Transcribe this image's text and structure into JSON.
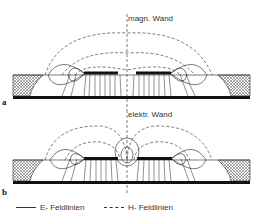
{
  "diagrams": [
    {
      "panel_label": "a",
      "wall_label": "magn. Wand"
    },
    {
      "panel_label": "b",
      "wall_label": "elektr. Wand"
    }
  ],
  "legend": {
    "e_field": "E- Feldlinien",
    "h_field": "H- Feldlinien"
  },
  "colors": {
    "line": "#222222",
    "background": "#ffffff"
  }
}
